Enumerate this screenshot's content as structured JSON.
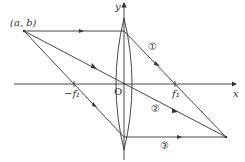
{
  "diagram": {
    "type": "thin convex lens ray diagram",
    "axes": {
      "x_label": "x",
      "y_label": "y",
      "origin_label": "O"
    },
    "object_point_label": "(a, b)",
    "focal_labels": {
      "left": "−f₁",
      "right": "f₁"
    },
    "rays": [
      {
        "id": "1",
        "label": "①",
        "description": "parallel to axis, refracted through right focus f₁"
      },
      {
        "id": "2",
        "label": "②",
        "description": "through optical center O, undeviated"
      },
      {
        "id": "3",
        "label": "③",
        "description": "through left focus −f₁, exits parallel to axis"
      }
    ],
    "colors": {
      "line": "#333333",
      "background": "#ffffff"
    }
  }
}
